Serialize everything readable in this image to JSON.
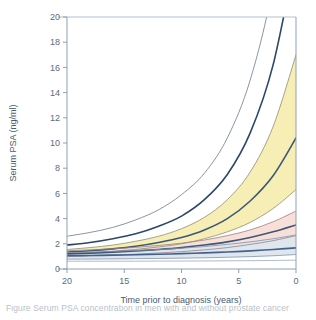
{
  "figure": {
    "background_color": "#ffffff",
    "caption_partial": "Figure   Serum PSA concentration in men with and without prostate cancer"
  },
  "chart_data": {
    "type": "line",
    "title": "",
    "subtitle": "",
    "xlabel": "Time prior to diagnosis (years)",
    "ylabel": "Serum PSA (ng/ml)",
    "xlim": [
      20,
      0
    ],
    "ylim": [
      0,
      20
    ],
    "x_reversed": true,
    "xticks": [
      20,
      15,
      10,
      5,
      0
    ],
    "yticks": [
      0,
      2,
      4,
      6,
      8,
      10,
      12,
      14,
      16,
      18,
      20
    ],
    "xtick_labels": [
      "20",
      "15",
      "10",
      "5",
      "0"
    ],
    "ytick_labels": [
      "0",
      "2",
      "4",
      "6",
      "8",
      "10",
      "12",
      "14",
      "16",
      "18",
      "20"
    ],
    "grid": false,
    "legend": null,
    "legend_position": "none",
    "x": [
      20,
      18,
      16,
      14,
      12,
      10,
      8,
      6,
      4,
      2,
      0
    ],
    "series": [
      {
        "name": "curve-1-upper-outer",
        "style": "thin",
        "color": "#6b7a90",
        "values": [
          2.6,
          2.9,
          3.3,
          3.9,
          4.7,
          5.9,
          7.6,
          10.4,
          15.0,
          22.5,
          34.0
        ]
      },
      {
        "name": "curve-2-upper-thick",
        "style": "thick",
        "color": "#2c4769",
        "values": [
          1.9,
          2.1,
          2.4,
          2.8,
          3.4,
          4.2,
          5.5,
          7.5,
          10.8,
          16.2,
          25.0
        ]
      },
      {
        "name": "curve-3-yellow-upper",
        "style": "thin",
        "color": "#8d8f70",
        "values": [
          1.55,
          1.7,
          1.9,
          2.2,
          2.6,
          3.2,
          4.1,
          5.5,
          7.7,
          11.3,
          17.0
        ]
      },
      {
        "name": "curve-4-yellow-mid-thick",
        "style": "thick",
        "color": "#3c5878",
        "values": [
          1.35,
          1.45,
          1.6,
          1.8,
          2.1,
          2.5,
          3.1,
          4.0,
          5.4,
          7.4,
          10.4
        ]
      },
      {
        "name": "curve-5-yellow-lower",
        "style": "thin",
        "color": "#8d8f70",
        "values": [
          1.2,
          1.28,
          1.4,
          1.55,
          1.75,
          2.0,
          2.4,
          2.95,
          3.7,
          4.8,
          6.3
        ]
      },
      {
        "name": "curve-6-pink-upper",
        "style": "thin",
        "color": "#9b8088",
        "values": [
          1.45,
          1.52,
          1.6,
          1.72,
          1.87,
          2.05,
          2.3,
          2.65,
          3.1,
          3.75,
          4.6
        ]
      },
      {
        "name": "curve-7-pink-mid-thick",
        "style": "thick",
        "color": "#3c5878",
        "values": [
          1.2,
          1.26,
          1.34,
          1.43,
          1.55,
          1.7,
          1.9,
          2.15,
          2.5,
          2.95,
          3.5
        ]
      },
      {
        "name": "curve-8-pink-lower",
        "style": "thin",
        "color": "#9b8088",
        "values": [
          1.0,
          1.05,
          1.1,
          1.18,
          1.27,
          1.38,
          1.52,
          1.7,
          1.95,
          2.25,
          2.65
        ]
      },
      {
        "name": "curve-9-blue-upper",
        "style": "thin",
        "color": "#7f92ab",
        "values": [
          1.3,
          1.34,
          1.4,
          1.47,
          1.55,
          1.65,
          1.78,
          1.95,
          2.15,
          2.4,
          2.7
        ]
      },
      {
        "name": "curve-10-blue-mid-thick",
        "style": "thick",
        "color": "#44618a",
        "values": [
          1.05,
          1.07,
          1.1,
          1.13,
          1.17,
          1.22,
          1.28,
          1.35,
          1.44,
          1.55,
          1.68
        ]
      },
      {
        "name": "curve-11-blue-lower",
        "style": "thin",
        "color": "#7f92ab",
        "values": [
          0.78,
          0.79,
          0.8,
          0.82,
          0.84,
          0.86,
          0.89,
          0.93,
          0.98,
          1.05,
          1.15
        ]
      },
      {
        "name": "curve-12-baseline",
        "style": "thin",
        "color": "#9aa9bd",
        "values": [
          0.62,
          0.62,
          0.62,
          0.62,
          0.63,
          0.63,
          0.64,
          0.65,
          0.66,
          0.68,
          0.7
        ]
      }
    ],
    "bands": [
      {
        "name": "band-yellow",
        "color": "#f7eeb5",
        "upper_series": "curve-3-yellow-upper",
        "lower_series": "curve-5-yellow-lower"
      },
      {
        "name": "band-pink",
        "color": "#f8e0d8",
        "upper_series": "curve-6-pink-upper",
        "lower_series": "curve-8-pink-lower"
      },
      {
        "name": "band-blue",
        "color": "#dfe6ee",
        "upper_series": "curve-9-blue-upper",
        "lower_series": "curve-11-blue-lower"
      }
    ],
    "colors": {
      "axis": "#8fa0b5",
      "tick_label": "#5b6b84",
      "axis_title": "#4a5a73",
      "band_yellow": "#f7eeb5",
      "band_pink": "#f8e0d8",
      "band_blue": "#dfe6ee",
      "curve_dark": "#2c4769",
      "curve_light": "#8fa0b5"
    }
  }
}
